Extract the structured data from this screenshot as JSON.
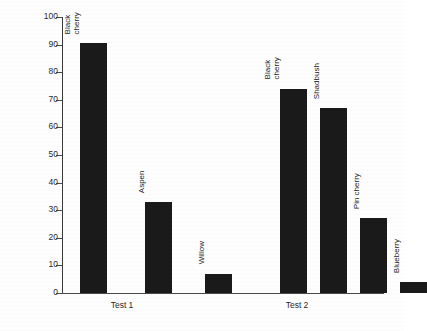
{
  "chart_data": {
    "type": "bar",
    "title": "",
    "xlabel": "",
    "ylabel": "Percent recruiting",
    "ylim": [
      0,
      100
    ],
    "ytick_step": 10,
    "yticks": [
      0,
      10,
      20,
      30,
      40,
      50,
      60,
      70,
      80,
      90,
      100
    ],
    "ytick_labels": [
      "0",
      "10",
      "20",
      "30",
      "40",
      "50",
      "60",
      "70",
      "80",
      "90",
      "100"
    ],
    "grid": false,
    "legend": "none",
    "bar_color": "#1a1a1a",
    "groups": [
      {
        "name": "Test 1",
        "bars": [
          {
            "label_line1": "Black",
            "label_line2": "cherry",
            "label": "Black cherry",
            "value": 90.5
          },
          {
            "label_line1": "Aspen",
            "label_line2": "",
            "label": "Aspen",
            "value": 33
          },
          {
            "label_line1": "Willow",
            "label_line2": "",
            "label": "Willow",
            "value": 7
          }
        ]
      },
      {
        "name": "Test 2",
        "bars": [
          {
            "label_line1": "Black",
            "label_line2": "cherry",
            "label": "Black cherry",
            "value": 74
          },
          {
            "label_line1": "Shadbush",
            "label_line2": "",
            "label": "Shadbush",
            "value": 67
          },
          {
            "label_line1": "Pin cherry",
            "label_line2": "",
            "label": "Pin cherry",
            "value": 27
          },
          {
            "label_line1": "Blueberry",
            "label_line2": "",
            "label": "Blueberry",
            "value": 4
          }
        ]
      }
    ],
    "categories": [
      "Black cherry",
      "Aspen",
      "Willow",
      "Black cherry",
      "Shadbush",
      "Pin cherry",
      "Blueberry"
    ],
    "values": [
      90.5,
      33,
      7,
      74,
      67,
      27,
      4
    ]
  },
  "layout": {
    "plot_left": 62,
    "plot_top": 17,
    "plot_width": 322,
    "plot_height": 277,
    "bar_width": 27,
    "bar_x_positions": [
      18,
      83,
      143,
      218,
      258,
      298,
      338
    ],
    "group_label_x": [
      60,
      235
    ]
  }
}
